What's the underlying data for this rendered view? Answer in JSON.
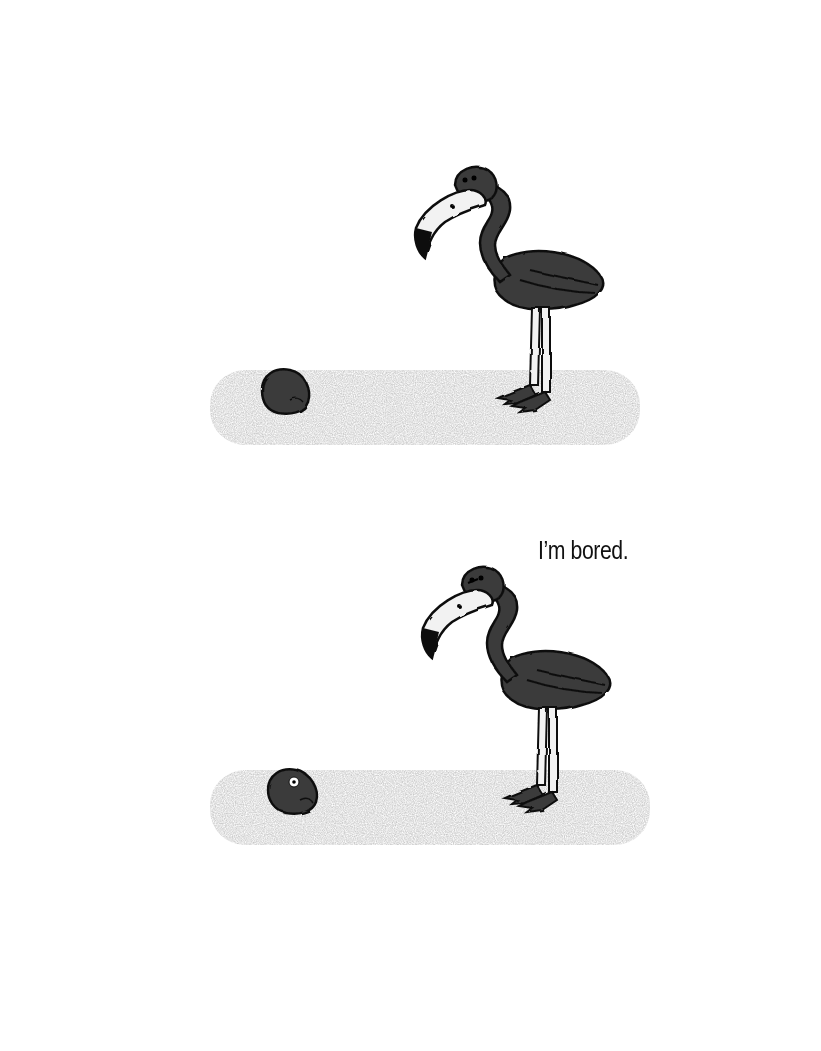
{
  "illustration": {
    "panels": [
      {
        "id": "panel-1",
        "characters": [
          "flamingo",
          "rock"
        ],
        "speech": ""
      },
      {
        "id": "panel-2",
        "characters": [
          "flamingo",
          "rock-with-eye"
        ],
        "speech": "I’m bored."
      }
    ],
    "colors": {
      "ink": "#1a1a1a",
      "body": "#3a3a3a",
      "ground": "#d9d9d9",
      "paper": "#ffffff"
    }
  }
}
